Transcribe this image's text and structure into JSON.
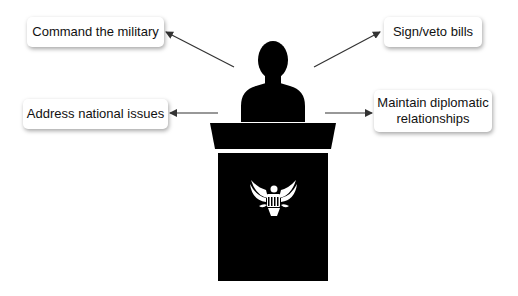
{
  "diagram": {
    "labels": {
      "top_left": "Command the military",
      "top_right": "Sign/veto bills",
      "mid_left": "Address national issues",
      "mid_right_line1": "Maintain diplomatic",
      "mid_right_line2": "relationships"
    },
    "colors": {
      "silhouette": "#000000",
      "arrow": "#333333",
      "box_background": "#ffffff",
      "emblem": "#ffffff"
    },
    "emblem": "eagle-seal"
  }
}
